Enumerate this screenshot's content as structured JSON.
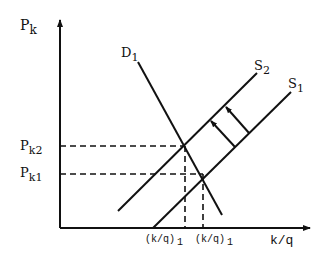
{
  "diagram": {
    "type": "supply-demand shift",
    "axes": {
      "y_label": "P",
      "y_label_sub": "k",
      "x_label": "k/q"
    },
    "price_levels": [
      {
        "label": "P",
        "sub": "k2",
        "y": 146
      },
      {
        "label": "P",
        "sub": "k1",
        "y": 174
      }
    ],
    "quantity_levels": [
      {
        "label": "(k/q)",
        "sub": "1",
        "x": 185
      },
      {
        "label": "(k/q)",
        "sub": "1",
        "x": 203
      }
    ],
    "curves": [
      {
        "name": "D",
        "sub": "1",
        "type": "demand"
      },
      {
        "name": "S",
        "sub": "2",
        "type": "supply"
      },
      {
        "name": "S",
        "sub": "1",
        "type": "supply"
      }
    ],
    "shift_arrows": 2,
    "colors": {
      "line": "#111111",
      "background": "#ffffff"
    }
  }
}
